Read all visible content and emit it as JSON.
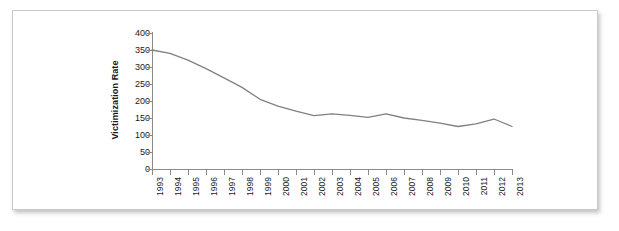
{
  "chart_data": {
    "type": "line",
    "title": "",
    "xlabel": "",
    "ylabel": "Victimization Rate",
    "ylim": [
      0,
      400
    ],
    "ytick_step": 50,
    "yticks": [
      0,
      50,
      100,
      150,
      200,
      250,
      300,
      350,
      400
    ],
    "grid": false,
    "legend": "none",
    "line_color": "#808080",
    "categories": [
      "1993",
      "1994",
      "1995",
      "1996",
      "1997",
      "1998",
      "1999",
      "2000",
      "2001",
      "2002",
      "2003",
      "2004",
      "2005",
      "2006",
      "2007",
      "2008",
      "2009",
      "2010",
      "2011",
      "2012",
      "2013"
    ],
    "values": [
      350,
      340,
      320,
      295,
      268,
      240,
      205,
      185,
      170,
      157,
      162,
      158,
      152,
      162,
      150,
      143,
      135,
      125,
      133,
      147,
      125
    ]
  },
  "chart": {
    "y_axis_title": "Victimization Rate"
  }
}
